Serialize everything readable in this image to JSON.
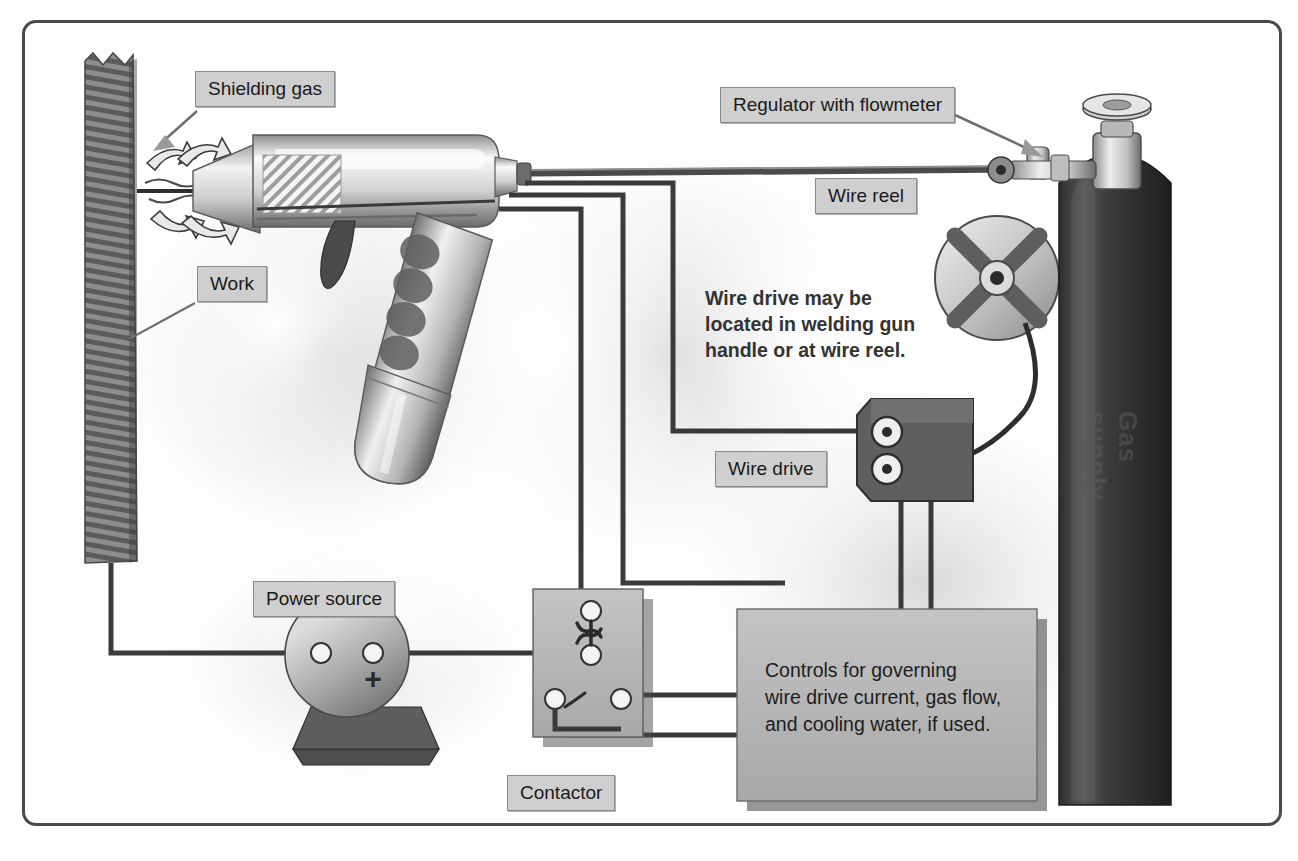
{
  "diagram": {
    "background": "#ffffff",
    "frame_color": "#4a4a4a"
  },
  "labels": [
    {
      "id": "shielding-gas",
      "text": "Shielding gas",
      "x": 170,
      "y": 48
    },
    {
      "id": "work",
      "text": "Work",
      "x": 172,
      "y": 243
    },
    {
      "id": "regulator",
      "text": "Regulator with flowmeter",
      "x": 717,
      "y": 76
    },
    {
      "id": "wire-reel",
      "text": "Wire reel",
      "x": 808,
      "y": 165
    },
    {
      "id": "wire-drive",
      "text": "Wire drive",
      "x": 708,
      "y": 440
    },
    {
      "id": "power-source",
      "text": "Power source",
      "x": 248,
      "y": 570
    },
    {
      "id": "contactor",
      "text": "Contactor",
      "x": 500,
      "y": 764
    }
  ],
  "notes": {
    "wire_drive_note": "Wire drive may be\nlocated in welding gun\nhandle or at wire reel.",
    "controls_text": "Controls for governing\nwire drive current, gas flow,\nand cooling water, if used."
  },
  "cylinder": {
    "vertical_text": "Gas supply",
    "body_color": "#3c3c3c"
  },
  "power_source": {
    "polarity_marker": "+",
    "terminals": 2
  },
  "components": [
    {
      "name": "workpiece",
      "description": "hatched vertical plate at left"
    },
    {
      "name": "welding-gun",
      "description": "pistol-grip MIG gun with nozzle and insulator band"
    },
    {
      "name": "gas-hose",
      "description": "hose from gun to regulator"
    },
    {
      "name": "wire-reel",
      "description": "spool with four-spoke hub"
    },
    {
      "name": "wire-drive",
      "description": "feeder box with two drive rollers"
    },
    {
      "name": "contactor",
      "description": "relay box with four terminals"
    },
    {
      "name": "controls-box",
      "description": "large control cabinet"
    },
    {
      "name": "gas-cylinder",
      "description": "tall gas bottle with valve and handwheel"
    }
  ],
  "colors": {
    "label_fill": "#cfcfcf",
    "label_border": "#8a8a8a",
    "box_fill": "#b8b8b8",
    "cable": "#3a3a3a",
    "metal_light": "#e8e8e8",
    "metal_dark": "#707070"
  }
}
